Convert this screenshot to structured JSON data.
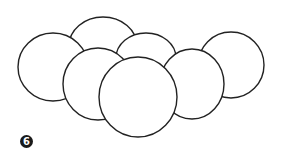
{
  "figure": {
    "label": "6",
    "stroke_color": "#222222",
    "fill_color": "#ffffff",
    "circles": [
      {
        "name": "back-left-circle",
        "cx": 103,
        "cy": 46,
        "rx": 34,
        "ry": 29
      },
      {
        "name": "back-middle-circle",
        "cx": 146,
        "cy": 58,
        "rx": 30,
        "ry": 25
      },
      {
        "name": "left-circle",
        "cx": 53,
        "cy": 67,
        "rx": 35,
        "ry": 34
      },
      {
        "name": "right-circle",
        "cx": 231,
        "cy": 65,
        "rx": 33,
        "ry": 33
      },
      {
        "name": "middle-left-circle",
        "cx": 98,
        "cy": 84,
        "rx": 35,
        "ry": 36
      },
      {
        "name": "middle-right-circle",
        "cx": 192,
        "cy": 84,
        "rx": 32,
        "ry": 35
      },
      {
        "name": "front-circle",
        "cx": 138,
        "cy": 97,
        "rx": 39,
        "ry": 40
      }
    ]
  }
}
